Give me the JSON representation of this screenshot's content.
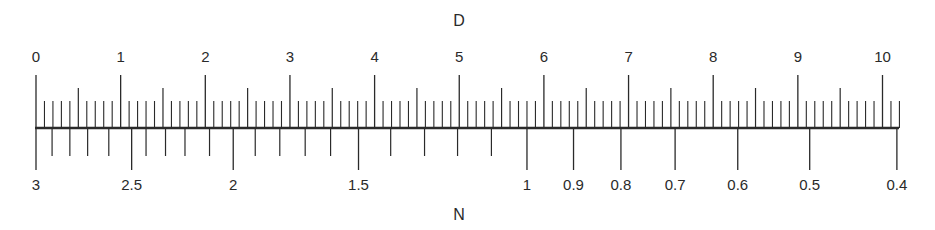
{
  "diagram": {
    "top_scale": {
      "name": "D",
      "type": "linear",
      "labels": [
        "0",
        "1",
        "2",
        "3",
        "4",
        "5",
        "6",
        "7",
        "8",
        "9",
        "10"
      ],
      "range": [
        0,
        10.2
      ],
      "minor_step": 0.1,
      "medium_step": 0.5,
      "major_step": 1
    },
    "bottom_scale": {
      "name": "N",
      "labels": [
        {
          "text": "3",
          "d": 0.0
        },
        {
          "text": "2.5",
          "d": 1.13
        },
        {
          "text": "2",
          "d": 2.33
        },
        {
          "text": "1.5",
          "d": 3.81
        },
        {
          "text": "1",
          "d": 5.8
        },
        {
          "text": "0.9",
          "d": 6.35
        },
        {
          "text": "0.8",
          "d": 6.91
        },
        {
          "text": "0.7",
          "d": 7.55
        },
        {
          "text": "0.6",
          "d": 8.29
        },
        {
          "text": "0.5",
          "d": 9.14
        },
        {
          "text": "0.4",
          "d": 10.17
        }
      ],
      "minor_ticks_d": [
        0.19,
        0.4,
        0.61,
        0.86,
        1.3,
        1.53,
        1.76,
        2.05,
        2.59,
        2.88,
        3.18,
        3.48,
        4.19,
        4.59,
        4.98,
        5.38
      ]
    },
    "colors": {
      "line": "#2a2a2a",
      "background": "#ffffff"
    }
  }
}
